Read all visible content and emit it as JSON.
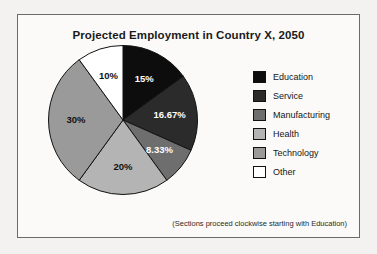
{
  "figure": {
    "title": "Projected Employment in Country X, 2050",
    "footnote": "(Sections proceed clockwise starting with Education)"
  },
  "legend": {
    "items": [
      {
        "label": "Education",
        "color": "#0d0d0d"
      },
      {
        "label": "Service",
        "color": "#2b2b2b"
      },
      {
        "label": "Manufacturing",
        "color": "#6e6e6e"
      },
      {
        "label": "Health",
        "color": "#b4b4b4"
      },
      {
        "label": "Technology",
        "color": "#9a9a9a"
      },
      {
        "label": "Other",
        "color": "#ffffff"
      }
    ]
  },
  "chart_data": {
    "type": "pie",
    "title": "Projected Employment in Country X, 2050",
    "annotation": "(Sections proceed clockwise starting with Education)",
    "start_angle_deg": 0,
    "direction": "clockwise",
    "legend_position": "right",
    "categories": [
      "Education",
      "Service",
      "Manufacturing",
      "Health",
      "Technology",
      "Other"
    ],
    "values": [
      15,
      16.67,
      8.33,
      20,
      30,
      10
    ],
    "labels": [
      "15%",
      "16.67%",
      "8.33%",
      "20%",
      "30%",
      "10%"
    ],
    "colors": [
      "#0d0d0d",
      "#2b2b2b",
      "#6e6e6e",
      "#b4b4b4",
      "#9a9a9a",
      "#ffffff"
    ],
    "label_colors": [
      "#ffffff",
      "#ffffff",
      "#ffffff",
      "#111111",
      "#111111",
      "#111111"
    ],
    "units": "percent",
    "total": 100
  }
}
